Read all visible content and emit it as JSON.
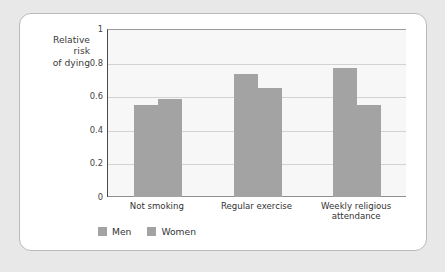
{
  "card": {
    "background_color": "#ffffff",
    "border_color": "#b9b9b9",
    "page_background_color": "#e8e8e8"
  },
  "chart_data": {
    "type": "bar",
    "title": "",
    "subtitle": "",
    "xlabel": "",
    "ylabel": "Relative\nrisk\nof dying",
    "ylim": [
      0,
      1
    ],
    "yticks": [
      "0",
      "0.2",
      "0.4",
      "0.6",
      "0.8",
      "1"
    ],
    "ytick_values": [
      0,
      0.2,
      0.4,
      0.6,
      0.8,
      1
    ],
    "grid": true,
    "grid_axis": "y",
    "legend_position": "bottom-left",
    "bar_color": "#a3a3a3",
    "categories": [
      "Not smoking",
      "Regular exercise",
      "Weekly religious\nattendance"
    ],
    "series": [
      {
        "name": "Men",
        "values": [
          0.545,
          0.73,
          0.765
        ],
        "color": "#a3a3a3"
      },
      {
        "name": "Women",
        "values": [
          0.585,
          0.65,
          0.545
        ],
        "color": "#a3a3a3"
      }
    ]
  }
}
